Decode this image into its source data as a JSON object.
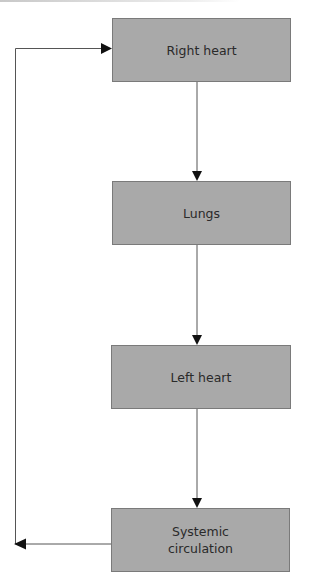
{
  "diagram": {
    "type": "flowchart",
    "colors": {
      "box_fill": "#a9a9a9",
      "box_border": "#7a7a7a",
      "line": "#555555",
      "arrow": "#111111",
      "text": "#2a2a2a"
    },
    "nodes": [
      {
        "id": "right_heart",
        "label": "Right heart"
      },
      {
        "id": "lungs",
        "label": "Lungs"
      },
      {
        "id": "left_heart",
        "label": "Left heart"
      },
      {
        "id": "systemic",
        "label_line1": "Systemic",
        "label_line2": "circulation"
      }
    ],
    "edges": [
      {
        "from": "right_heart",
        "to": "lungs"
      },
      {
        "from": "lungs",
        "to": "left_heart"
      },
      {
        "from": "left_heart",
        "to": "systemic"
      },
      {
        "from": "systemic",
        "to": "right_heart",
        "route": "left loop"
      }
    ]
  }
}
